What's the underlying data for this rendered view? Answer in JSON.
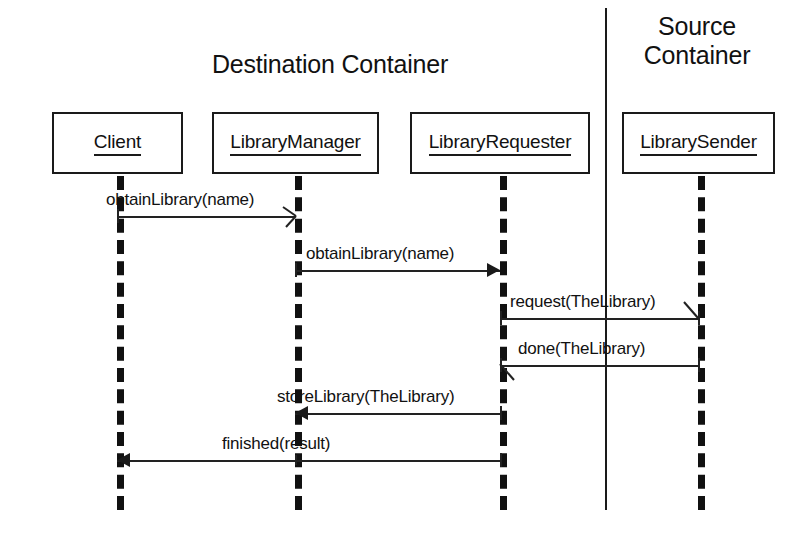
{
  "diagram": {
    "type": "uml-sequence-diagram",
    "groups": [
      {
        "id": "destination",
        "label": "Destination Container"
      },
      {
        "id": "source",
        "label": "Source\nContainer"
      }
    ],
    "participants": [
      {
        "id": "client",
        "label": "Client",
        "x": 117
      },
      {
        "id": "library_manager",
        "label": "LibraryManager",
        "x": 295
      },
      {
        "id": "library_requester",
        "label": "LibraryRequester",
        "x": 500
      },
      {
        "id": "library_sender",
        "label": "LibrarySender",
        "x": 698
      }
    ],
    "messages": [
      {
        "seq": 1,
        "label": "obtainLibrary(name)",
        "from": "client",
        "to": "library_manager",
        "arrow": "open",
        "direction": "right"
      },
      {
        "seq": 2,
        "label": "obtainLibrary(name)",
        "from": "library_manager",
        "to": "library_requester",
        "arrow": "solid",
        "direction": "right"
      },
      {
        "seq": 3,
        "label": "request(TheLibrary)",
        "from": "library_requester",
        "to": "library_sender",
        "arrow": "open",
        "direction": "right"
      },
      {
        "seq": 4,
        "label": "done(TheLibrary)",
        "from": "library_sender",
        "to": "library_requester",
        "arrow": "open",
        "direction": "left"
      },
      {
        "seq": 5,
        "label": "storeLibrary(TheLibrary)",
        "from": "library_requester",
        "to": "library_manager",
        "arrow": "solid",
        "direction": "left"
      },
      {
        "seq": 6,
        "label": "finished(result)",
        "from": "library_requester",
        "to": "client",
        "arrow": "solid",
        "direction": "left"
      }
    ],
    "colors": {
      "stroke": "#1a1a1a",
      "background": "#ffffff"
    }
  }
}
